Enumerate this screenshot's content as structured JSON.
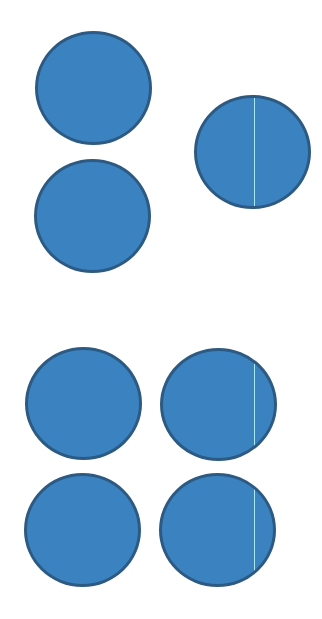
{
  "colors": {
    "fill": "#3b82c0",
    "stroke": "#2c5a82",
    "line": "#a6e6ef",
    "background": "#ffffff"
  },
  "groups": [
    {
      "name": "top-group",
      "circles": [
        {
          "x": 35,
          "y": 31,
          "w": 117,
          "h": 114
        },
        {
          "x": 34,
          "y": 159,
          "w": 117,
          "h": 114
        },
        {
          "x": 194,
          "y": 95,
          "w": 117,
          "h": 114,
          "line": {
            "x": 60,
            "top": 0,
            "bottom": 114
          }
        }
      ]
    },
    {
      "name": "bottom-group",
      "circles": [
        {
          "x": 25,
          "y": 347,
          "w": 117,
          "h": 113
        },
        {
          "x": 160,
          "y": 348,
          "w": 117,
          "h": 113,
          "line": {
            "x": 94,
            "top": 0,
            "bottom": 102
          }
        },
        {
          "x": 24,
          "y": 473,
          "w": 117,
          "h": 114
        },
        {
          "x": 159,
          "y": 473,
          "w": 117,
          "h": 114,
          "line": {
            "x": 95,
            "top": 14,
            "bottom": 99
          }
        }
      ]
    }
  ]
}
